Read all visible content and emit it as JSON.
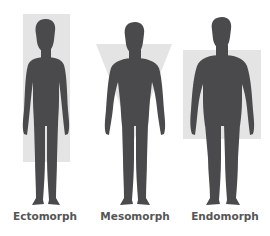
{
  "diagram": {
    "colors": {
      "silhouette": "#4a4a4c",
      "shape_fill": "#e4e4e4",
      "label": "#555555",
      "background": "#ffffff"
    },
    "body_types": [
      {
        "label": "Ectomorph",
        "shape": "tall-rectangle"
      },
      {
        "label": "Mesomorph",
        "shape": "inverted-triangle"
      },
      {
        "label": "Endomorph",
        "shape": "wide-rectangle"
      }
    ]
  }
}
